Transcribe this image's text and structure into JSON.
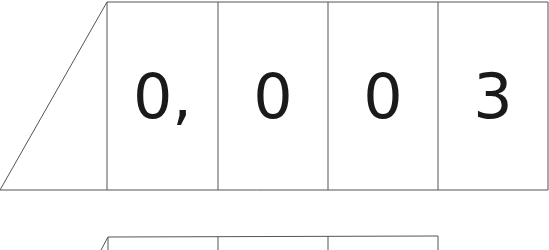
{
  "diagram": {
    "top_row": {
      "cells": [
        "0,",
        "0",
        "0",
        "3"
      ]
    },
    "bottom_row": {
      "cells": [
        "",
        "",
        ""
      ]
    },
    "colors": {
      "line": "#555555",
      "text": "#1a1a1a",
      "background": "#ffffff"
    }
  }
}
